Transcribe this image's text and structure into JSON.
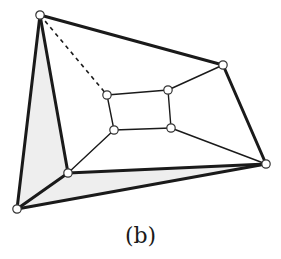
{
  "figure": {
    "caption": "(b)",
    "colors": {
      "edge": "#1a1a1a",
      "node_fill": "#ffffff",
      "node_stroke": "#333333",
      "face_fill": "#eeeeee",
      "background": "#ffffff"
    },
    "nodes": [
      {
        "id": "A",
        "x": 40,
        "y": 15
      },
      {
        "id": "B",
        "x": 223,
        "y": 65
      },
      {
        "id": "C",
        "x": 266,
        "y": 164
      },
      {
        "id": "D",
        "x": 17,
        "y": 209
      },
      {
        "id": "E",
        "x": 68,
        "y": 173
      },
      {
        "id": "P1",
        "x": 107,
        "y": 95
      },
      {
        "id": "P2",
        "x": 168,
        "y": 90
      },
      {
        "id": "P3",
        "x": 114,
        "y": 130
      },
      {
        "id": "P4",
        "x": 171,
        "y": 128
      }
    ],
    "shaded_faces": [
      [
        "A",
        "D",
        "E"
      ],
      [
        "D",
        "E",
        "C"
      ]
    ],
    "edges": [
      {
        "from": "A",
        "to": "B",
        "style": "thick"
      },
      {
        "from": "B",
        "to": "C",
        "style": "thick"
      },
      {
        "from": "A",
        "to": "D",
        "style": "thick"
      },
      {
        "from": "A",
        "to": "E",
        "style": "thick"
      },
      {
        "from": "D",
        "to": "E",
        "style": "thick"
      },
      {
        "from": "D",
        "to": "C",
        "style": "thick"
      },
      {
        "from": "E",
        "to": "C",
        "style": "thick"
      },
      {
        "from": "A",
        "to": "P1",
        "style": "dashed"
      },
      {
        "from": "P1",
        "to": "P2",
        "style": "thin"
      },
      {
        "from": "P1",
        "to": "P3",
        "style": "thin"
      },
      {
        "from": "P2",
        "to": "P4",
        "style": "thin"
      },
      {
        "from": "P3",
        "to": "P4",
        "style": "thin"
      },
      {
        "from": "P2",
        "to": "B",
        "style": "thin"
      },
      {
        "from": "P3",
        "to": "E",
        "style": "thin"
      },
      {
        "from": "P4",
        "to": "C",
        "style": "thin"
      }
    ]
  }
}
